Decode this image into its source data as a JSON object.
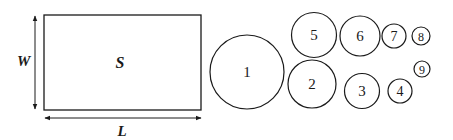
{
  "diagram": {
    "stroke_color": "#1a1a1a",
    "background": "#ffffff",
    "sheet": {
      "label": "S",
      "width_label": "W",
      "length_label": "L",
      "rect": {
        "x": 44,
        "y": 15,
        "w": 157,
        "h": 95
      }
    },
    "circles": [
      {
        "id": "1",
        "label": "1",
        "cx": 247,
        "cy": 72,
        "r": 37
      },
      {
        "id": "2",
        "label": "2",
        "cx": 312,
        "cy": 84,
        "r": 24
      },
      {
        "id": "3",
        "label": "3",
        "cx": 362,
        "cy": 91,
        "r": 17.5
      },
      {
        "id": "4",
        "label": "4",
        "cx": 400,
        "cy": 91,
        "r": 12
      },
      {
        "id": "5",
        "label": "5",
        "cx": 314,
        "cy": 35,
        "r": 22.5
      },
      {
        "id": "6",
        "label": "6",
        "cx": 360,
        "cy": 36,
        "r": 20
      },
      {
        "id": "7",
        "label": "7",
        "cx": 394,
        "cy": 36,
        "r": 12
      },
      {
        "id": "8",
        "label": "8",
        "cx": 421,
        "cy": 36,
        "r": 9
      },
      {
        "id": "9",
        "label": "9",
        "cx": 422,
        "cy": 69,
        "r": 8
      }
    ]
  }
}
